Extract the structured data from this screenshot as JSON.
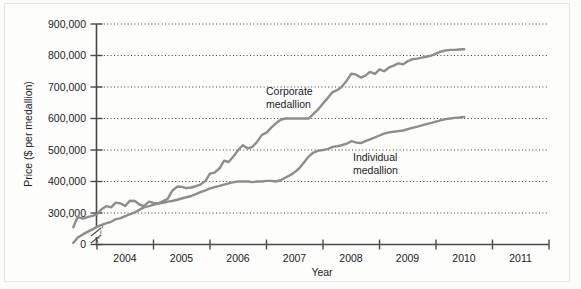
{
  "chart_data": {
    "type": "line",
    "title": "",
    "subtitle": "",
    "xlabel": "Year",
    "ylabel": "Price ($ per medallion)",
    "xlim": [
      2003.5,
      2011.25
    ],
    "ylim": [
      0,
      900000
    ],
    "y_axis_break": true,
    "y_break_note": "axis broken between 0 and ~250,000",
    "grid": "horizontal dotted gridlines at each 100,000 tick",
    "legend_position": "inline annotations on plot",
    "x_ticks": [
      2004,
      2005,
      2006,
      2007,
      2008,
      2009,
      2010,
      2011
    ],
    "x_tick_labels": [
      "2004",
      "2005",
      "2006",
      "2007",
      "2008",
      "2009",
      "2010",
      "2011"
    ],
    "y_ticks": [
      0,
      300000,
      400000,
      500000,
      600000,
      700000,
      800000,
      900000
    ],
    "y_tick_labels": [
      "0",
      "300,000",
      "400,000",
      "500,000",
      "600,000",
      "700,000",
      "800,000",
      "900,000"
    ],
    "series": [
      {
        "name": "Corporate medallion",
        "color": "#8d8d8d",
        "annotation": {
          "line1": "Corporate",
          "line2": "medallion"
        },
        "x": [
          2003.58,
          2003.66,
          2003.75,
          2003.83,
          2003.92,
          2004.0,
          2004.08,
          2004.17,
          2004.25,
          2004.33,
          2004.42,
          2004.5,
          2004.58,
          2004.67,
          2004.75,
          2004.83,
          2004.92,
          2005.0,
          2005.08,
          2005.17,
          2005.25,
          2005.33,
          2005.42,
          2005.5,
          2005.58,
          2005.67,
          2005.75,
          2005.83,
          2005.92,
          2006.0,
          2006.08,
          2006.17,
          2006.25,
          2006.33,
          2006.42,
          2006.5,
          2006.58,
          2006.67,
          2006.75,
          2006.83,
          2006.92,
          2007.0,
          2007.08,
          2007.17,
          2007.25,
          2007.33,
          2007.42,
          2007.5,
          2007.58,
          2007.67,
          2007.75,
          2007.83,
          2007.92,
          2008.0,
          2008.08,
          2008.17,
          2008.25,
          2008.33,
          2008.42,
          2008.5,
          2008.58,
          2008.67,
          2008.75,
          2008.83,
          2008.92,
          2009.0,
          2009.08,
          2009.17,
          2009.25,
          2009.33,
          2009.42,
          2009.5,
          2009.58,
          2009.67,
          2009.75,
          2009.83,
          2009.92,
          2010.0,
          2010.08,
          2010.17,
          2010.25,
          2010.33,
          2010.42,
          2010.5
        ],
        "y": [
          255000,
          288000,
          282000,
          287000,
          291000,
          296000,
          312000,
          322000,
          318000,
          333000,
          330000,
          322000,
          339000,
          338000,
          327000,
          322000,
          336000,
          332000,
          330000,
          338000,
          345000,
          370000,
          384000,
          383000,
          379000,
          381000,
          385000,
          390000,
          402000,
          425000,
          428000,
          442000,
          466000,
          462000,
          481000,
          500000,
          515000,
          505000,
          510000,
          525000,
          548000,
          555000,
          570000,
          585000,
          596000,
          600000,
          600000,
          600000,
          600000,
          600000,
          600000,
          615000,
          630000,
          648000,
          664000,
          684000,
          690000,
          700000,
          720000,
          742000,
          740000,
          730000,
          736000,
          748000,
          742000,
          756000,
          750000,
          762000,
          768000,
          775000,
          772000,
          782000,
          788000,
          790000,
          793000,
          796000,
          800000,
          806000,
          812000,
          816000,
          818000,
          818000,
          819000,
          820000
        ]
      },
      {
        "name": "Individual medallion",
        "color": "#8d8d8d",
        "annotation": {
          "line1": "Individual",
          "line2": "medallion"
        },
        "x": [
          2003.58,
          2003.66,
          2003.75,
          2003.83,
          2003.92,
          2004.0,
          2004.08,
          2004.17,
          2004.25,
          2004.33,
          2004.42,
          2004.5,
          2004.58,
          2004.67,
          2004.75,
          2004.83,
          2004.92,
          2005.0,
          2005.08,
          2005.17,
          2005.25,
          2005.33,
          2005.42,
          2005.5,
          2005.58,
          2005.67,
          2005.75,
          2005.83,
          2005.92,
          2006.0,
          2006.08,
          2006.17,
          2006.25,
          2006.33,
          2006.42,
          2006.5,
          2006.58,
          2006.67,
          2006.75,
          2006.83,
          2006.92,
          2007.0,
          2007.08,
          2007.17,
          2007.25,
          2007.33,
          2007.42,
          2007.5,
          2007.58,
          2007.67,
          2007.75,
          2007.83,
          2007.92,
          2008.0,
          2008.08,
          2008.17,
          2008.25,
          2008.33,
          2008.42,
          2008.5,
          2008.58,
          2008.67,
          2008.75,
          2008.83,
          2008.92,
          2009.0,
          2009.08,
          2009.17,
          2009.25,
          2009.33,
          2009.42,
          2009.5,
          2009.58,
          2009.67,
          2009.75,
          2009.83,
          2009.92,
          2010.0,
          2010.08,
          2010.17,
          2010.25,
          2010.33,
          2010.42,
          2010.5
        ],
        "y": [
          205000,
          222000,
          232000,
          240000,
          248000,
          256000,
          262000,
          268000,
          272000,
          280000,
          284000,
          290000,
          296000,
          302000,
          310000,
          318000,
          322000,
          326000,
          330000,
          332000,
          336000,
          338000,
          342000,
          346000,
          350000,
          354000,
          360000,
          366000,
          372000,
          378000,
          382000,
          386000,
          390000,
          394000,
          398000,
          400000,
          400000,
          400000,
          398000,
          400000,
          400000,
          402000,
          402000,
          400000,
          404000,
          412000,
          420000,
          430000,
          442000,
          462000,
          480000,
          492000,
          498000,
          500000,
          503000,
          510000,
          512000,
          515000,
          520000,
          528000,
          524000,
          522000,
          528000,
          534000,
          540000,
          546000,
          552000,
          556000,
          558000,
          560000,
          562000,
          566000,
          570000,
          574000,
          578000,
          582000,
          586000,
          590000,
          594000,
          598000,
          600000,
          602000,
          603000,
          605000
        ]
      }
    ]
  },
  "axes": {
    "y_axis_label": "Price ($ per medallion)",
    "x_axis_label": "Year"
  }
}
